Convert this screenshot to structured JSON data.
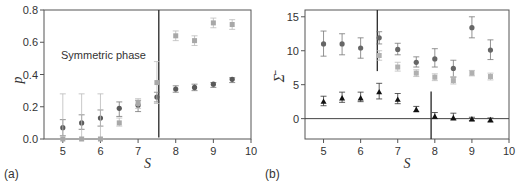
{
  "chart_data": [
    {
      "panel": "(a)",
      "type": "scatter",
      "title": "",
      "xlabel": "S",
      "ylabel": "p",
      "xlim": [
        4.5,
        10
      ],
      "ylim": [
        0.0,
        0.8
      ],
      "xticks": [
        "5",
        "6",
        "7",
        "8",
        "9",
        "10"
      ],
      "yticks": [
        "0.0",
        "0.2",
        "0.4",
        "0.6",
        "0.8"
      ],
      "grid": false,
      "annotations": [
        {
          "text": "Symmetric phase",
          "x": 5.0,
          "y": 0.53
        }
      ],
      "vlines": [
        {
          "x": 7.55,
          "y0": 0.01,
          "y1": 0.8
        }
      ],
      "series": [
        {
          "name": "dark",
          "color": "#5a5a5a",
          "marker": "circle",
          "points": [
            {
              "x": 5.0,
              "y": 0.07,
              "lo": 0.02,
              "hi": 0.12
            },
            {
              "x": 5.5,
              "y": 0.1,
              "lo": 0.06,
              "hi": 0.15
            },
            {
              "x": 6.0,
              "y": 0.13,
              "lo": 0.08,
              "hi": 0.18
            },
            {
              "x": 6.5,
              "y": 0.19,
              "lo": 0.14,
              "hi": 0.23
            },
            {
              "x": 7.0,
              "y": 0.21,
              "lo": 0.17,
              "hi": 0.24
            },
            {
              "x": 7.5,
              "y": 0.26,
              "lo": 0.23,
              "hi": 0.29
            },
            {
              "x": 8.0,
              "y": 0.31,
              "lo": 0.29,
              "hi": 0.33
            },
            {
              "x": 8.5,
              "y": 0.32,
              "lo": 0.3,
              "hi": 0.34
            },
            {
              "x": 9.0,
              "y": 0.34,
              "lo": 0.32,
              "hi": 0.35
            },
            {
              "x": 9.5,
              "y": 0.37,
              "lo": 0.35,
              "hi": 0.38
            }
          ]
        },
        {
          "name": "light",
          "color": "#a8a8a8",
          "marker": "square",
          "points": [
            {
              "x": 5.0,
              "y": 0.0,
              "lo": 0.0,
              "hi": 0.28
            },
            {
              "x": 5.5,
              "y": 0.0,
              "lo": 0.0,
              "hi": 0.28
            },
            {
              "x": 6.0,
              "y": 0.0,
              "lo": 0.0,
              "hi": 0.28
            },
            {
              "x": 6.5,
              "y": 0.1,
              "lo": 0.08,
              "hi": 0.13
            },
            {
              "x": 7.0,
              "y": 0.22,
              "lo": 0.19,
              "hi": 0.25
            },
            {
              "x": 7.5,
              "y": 0.35,
              "lo": 0.22,
              "hi": 0.48
            },
            {
              "x": 8.0,
              "y": 0.64,
              "lo": 0.61,
              "hi": 0.67
            },
            {
              "x": 8.5,
              "y": 0.61,
              "lo": 0.58,
              "hi": 0.64
            },
            {
              "x": 9.0,
              "y": 0.72,
              "lo": 0.69,
              "hi": 0.75
            },
            {
              "x": 9.5,
              "y": 0.71,
              "lo": 0.68,
              "hi": 0.74
            }
          ]
        }
      ]
    },
    {
      "panel": "(b)",
      "type": "scatter",
      "title": "",
      "xlabel": "S",
      "ylabel": "Σ̄",
      "xlim": [
        4.5,
        10
      ],
      "ylim": [
        -3,
        16
      ],
      "xticks": [
        "5",
        "6",
        "7",
        "8",
        "9",
        "10"
      ],
      "yticks": [
        "0",
        "5",
        "10",
        "15"
      ],
      "grid": false,
      "hlines": [
        {
          "y": 0
        }
      ],
      "vlines": [
        {
          "x": 6.45,
          "y0": 7,
          "y1": 16
        },
        {
          "x": 7.9,
          "y0": -3,
          "y1": 4
        }
      ],
      "series": [
        {
          "name": "dark circles",
          "color": "#666666",
          "marker": "circle",
          "points": [
            {
              "x": 5.0,
              "y": 11.0,
              "lo": 9.2,
              "hi": 12.9
            },
            {
              "x": 5.5,
              "y": 11.0,
              "lo": 9.4,
              "hi": 12.5
            },
            {
              "x": 6.0,
              "y": 10.4,
              "lo": 8.9,
              "hi": 11.9
            },
            {
              "x": 6.5,
              "y": 11.9,
              "lo": 11.0,
              "hi": 12.8
            },
            {
              "x": 7.0,
              "y": 10.2,
              "lo": 9.4,
              "hi": 11.1
            },
            {
              "x": 7.5,
              "y": 8.3,
              "lo": 7.6,
              "hi": 9.1
            },
            {
              "x": 8.0,
              "y": 8.8,
              "lo": 7.6,
              "hi": 10.3
            },
            {
              "x": 8.5,
              "y": 7.4,
              "lo": 6.1,
              "hi": 8.6
            },
            {
              "x": 9.0,
              "y": 13.4,
              "lo": 11.9,
              "hi": 15.0
            },
            {
              "x": 9.5,
              "y": 10.1,
              "lo": 8.7,
              "hi": 11.6
            }
          ]
        },
        {
          "name": "light squares",
          "color": "#b0b0b0",
          "marker": "square",
          "points": [
            {
              "x": 6.5,
              "y": 9.3,
              "lo": 8.6,
              "hi": 10.0
            },
            {
              "x": 7.0,
              "y": 7.6,
              "lo": 7.0,
              "hi": 8.3
            },
            {
              "x": 7.5,
              "y": 6.7,
              "lo": 6.2,
              "hi": 7.2
            },
            {
              "x": 8.0,
              "y": 6.1,
              "lo": 5.6,
              "hi": 6.6
            },
            {
              "x": 8.5,
              "y": 5.6,
              "lo": 5.1,
              "hi": 6.2
            },
            {
              "x": 9.0,
              "y": 6.7,
              "lo": 6.3,
              "hi": 7.1
            },
            {
              "x": 9.5,
              "y": 6.2,
              "lo": 5.7,
              "hi": 6.7
            }
          ]
        },
        {
          "name": "black triangles",
          "color": "#111111",
          "marker": "triangle",
          "points": [
            {
              "x": 5.0,
              "y": 2.5,
              "lo": 1.9,
              "hi": 3.3
            },
            {
              "x": 5.5,
              "y": 3.0,
              "lo": 2.4,
              "hi": 3.9
            },
            {
              "x": 6.0,
              "y": 3.0,
              "lo": 2.5,
              "hi": 3.9
            },
            {
              "x": 6.5,
              "y": 3.9,
              "lo": 2.9,
              "hi": 5.2
            },
            {
              "x": 7.0,
              "y": 2.8,
              "lo": 2.2,
              "hi": 3.7
            },
            {
              "x": 7.5,
              "y": 1.3,
              "lo": 1.0,
              "hi": 1.8
            },
            {
              "x": 8.0,
              "y": 0.3,
              "lo": 0.0,
              "hi": 0.9
            },
            {
              "x": 8.5,
              "y": 0.1,
              "lo": -0.2,
              "hi": 0.8
            },
            {
              "x": 9.0,
              "y": -0.1,
              "lo": -0.3,
              "hi": 0.2
            },
            {
              "x": 9.5,
              "y": -0.2,
              "lo": -0.5,
              "hi": 0.1
            }
          ]
        }
      ]
    }
  ],
  "labels": {
    "panel_a": "(a)",
    "panel_b": "(b)",
    "annotation_a": "Symmetric phase",
    "xlabel": "S",
    "ylabel_a": "p",
    "ylabel_b": "Σ̄"
  }
}
